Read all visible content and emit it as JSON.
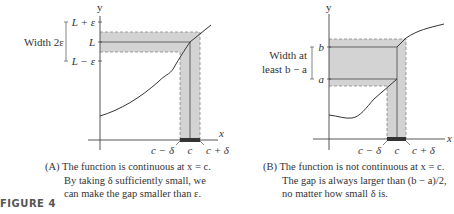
{
  "figure_label": "FIGURE 4",
  "panel_a": {
    "axis_x": "x",
    "axis_y": "y",
    "y_ticks": [
      "L + ε",
      "L",
      "L − ε"
    ],
    "width_label": "Width 2ε",
    "x_labels": [
      "c − δ",
      "c",
      "c + δ"
    ],
    "caption_lines": [
      "(A) The function is continuous at x = c.",
      "By taking δ sufficiently small, we",
      "can make the gap smaller than ε."
    ]
  },
  "panel_b": {
    "axis_x": "x",
    "axis_y": "y",
    "y_ticks": [
      "b",
      "a"
    ],
    "width_label_lines": [
      "Width at",
      "least b − a"
    ],
    "x_labels": [
      "c − δ",
      "c",
      "c + δ"
    ],
    "caption_lines": [
      "(B) The function is not continuous at x = c.",
      "The gap is always larger than (b − a)/2,",
      "no matter how small δ is."
    ]
  },
  "colors": {
    "shade": "#d3d3d3",
    "line": "#444444",
    "dash": "#888888"
  }
}
